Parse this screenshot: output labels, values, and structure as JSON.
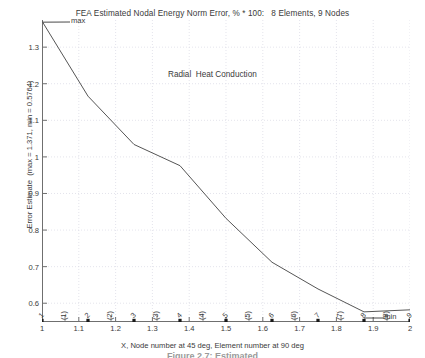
{
  "title": "FEA Estimated Nodal Energy Norm Error, % * 100:   8 Elements, 9 Nodes",
  "inner_annotation": "Radial  Heat Conduction",
  "caption": "Figure 2.7: Estimated",
  "axis": {
    "ylabel": "Error Estimate  (max = 1.371, min = 0.5764)",
    "xlabel": "X, Node number at 45 deg, Element number at 90 deg"
  },
  "markers": {
    "max_label": "max",
    "min_label": "min"
  },
  "chart_data": {
    "type": "line",
    "title": "FEA Estimated Nodal Energy Norm Error, % * 100:   8 Elements, 9 Nodes",
    "xlabel": "X, Node number at 45 deg, Element number at 90 deg",
    "ylabel": "Error Estimate  (max = 1.371, min = 0.5764)",
    "xlim": [
      1,
      2
    ],
    "ylim": [
      0.5487,
      1.3742
    ],
    "grid": true,
    "legend": null,
    "xticks": [
      "1",
      "1.1",
      "1.2",
      "1.3",
      "1.4",
      "1.5",
      "1.6",
      "1.7",
      "1.8",
      "1.9",
      "2"
    ],
    "xtick_values": [
      1,
      1.1,
      1.2,
      1.3,
      1.4,
      1.5,
      1.6,
      1.7,
      1.8,
      1.9,
      2
    ],
    "yticks": [
      "1.3",
      "1.2",
      "1.1",
      "1",
      "0.9",
      "0.8",
      "0.7",
      "0.6"
    ],
    "ytick_values": [
      1.3,
      1.2,
      1.1,
      1.0,
      0.9,
      0.8,
      0.7,
      0.6
    ],
    "max": 1.371,
    "min": 0.5764,
    "x": [
      1.0,
      1.125,
      1.25,
      1.375,
      1.5,
      1.625,
      1.75,
      1.875,
      2.0
    ],
    "values": [
      1.371,
      1.166,
      1.034,
      0.976,
      0.832,
      0.712,
      0.639,
      0.5764,
      0.582
    ],
    "nodes": [
      "1",
      "2",
      "3",
      "4",
      "5",
      "6",
      "7",
      "8",
      "9"
    ],
    "node_x": [
      1.0,
      1.125,
      1.25,
      1.375,
      1.5,
      1.625,
      1.75,
      1.875,
      2.0
    ],
    "elements": [
      "(1)",
      "(2)",
      "(3)",
      "(4)",
      "(5)",
      "(6)",
      "(7)",
      "(8)"
    ],
    "element_x": [
      1.0625,
      1.1875,
      1.3125,
      1.4375,
      1.5625,
      1.6875,
      1.8125,
      1.9375
    ],
    "line_color": "#555555",
    "grid_color": "#d9d9e4",
    "axis_color": "#6f6f6f",
    "marker_color": "#1a1a1a"
  }
}
